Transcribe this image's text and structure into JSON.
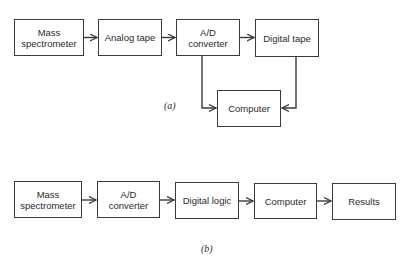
{
  "diagram_a": {
    "label": "(a)",
    "nodes": [
      {
        "id": "mass_spec",
        "text": "Mass\nspectrometer"
      },
      {
        "id": "analog_tape",
        "text": "Analog tape"
      },
      {
        "id": "ad_converter",
        "text": "A/D\nconverter"
      },
      {
        "id": "digital_tape",
        "text": "Digital tape"
      },
      {
        "id": "computer",
        "text": "Computer"
      }
    ],
    "edges": [
      [
        "mass_spec",
        "analog_tape"
      ],
      [
        "analog_tape",
        "ad_converter"
      ],
      [
        "ad_converter",
        "digital_tape"
      ],
      [
        "ad_converter",
        "computer"
      ],
      [
        "digital_tape",
        "computer"
      ]
    ]
  },
  "diagram_b": {
    "label": "(b)",
    "nodes": [
      {
        "id": "mass_spec",
        "text": "Mass\nspectrometer"
      },
      {
        "id": "ad_converter",
        "text": "A/D\nconverter"
      },
      {
        "id": "digital_logic",
        "text": "Digital logic"
      },
      {
        "id": "computer",
        "text": "Computer"
      },
      {
        "id": "results",
        "text": "Results"
      }
    ],
    "edges": [
      [
        "mass_spec",
        "ad_converter"
      ],
      [
        "ad_converter",
        "digital_logic"
      ],
      [
        "digital_logic",
        "computer"
      ],
      [
        "computer",
        "results"
      ]
    ]
  },
  "colors": {
    "line": "#3a3a3a",
    "background": "#ffffff"
  }
}
